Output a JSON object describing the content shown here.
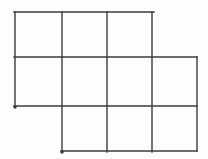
{
  "canvas": {
    "width": 208,
    "height": 159,
    "background_color": "#fdfdfc"
  },
  "figure": {
    "stroke_color": "#3b3b3b",
    "stroke_width": 1.4,
    "grid_x_lines": [
      15,
      62,
      107,
      152,
      197
    ],
    "grid_y_lines": [
      12,
      57,
      106,
      151
    ],
    "squares_per_row": [
      3,
      4,
      3
    ],
    "segments": [
      {
        "name": "top-edge",
        "x1": 14,
        "y1": 12,
        "x2": 154,
        "y2": 12
      },
      {
        "name": "middle-horizontal",
        "x1": 14,
        "y1": 57,
        "x2": 197,
        "y2": 57
      },
      {
        "name": "lower-horizontal",
        "x1": 14,
        "y1": 106,
        "x2": 197,
        "y2": 106
      },
      {
        "name": "bottom-edge",
        "x1": 61,
        "y1": 151,
        "x2": 197,
        "y2": 151
      },
      {
        "name": "left-edge",
        "x1": 15,
        "y1": 12,
        "x2": 15,
        "y2": 107,
        "dash": "4 1"
      },
      {
        "name": "vertical-2",
        "x1": 62,
        "y1": 12,
        "x2": 62,
        "y2": 152
      },
      {
        "name": "vertical-3",
        "x1": 107,
        "y1": 12,
        "x2": 107,
        "y2": 152
      },
      {
        "name": "vertical-4",
        "x1": 152,
        "y1": 12,
        "x2": 152,
        "y2": 152
      },
      {
        "name": "right-edge",
        "x1": 197,
        "y1": 57,
        "x2": 197,
        "y2": 151
      }
    ],
    "endpoint_dots": [
      {
        "name": "left-edge-end-dot",
        "x": 15,
        "y": 107,
        "r": 1.7
      },
      {
        "name": "bottom-edge-start-dot",
        "x": 62,
        "y": 152,
        "r": 1.7
      }
    ]
  }
}
